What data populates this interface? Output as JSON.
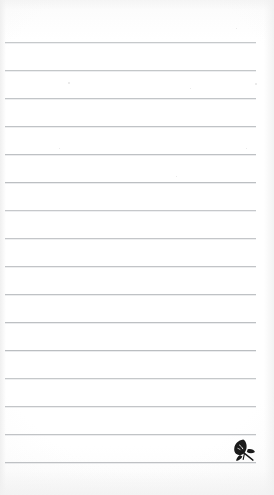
{
  "page": {
    "kind": "lined-notepad-scan",
    "width": 274,
    "height": 495,
    "paper_color": "#fdfdfd",
    "background_color": "#ffffff",
    "written_text": ""
  },
  "ruling": {
    "line_color": "#b9bcbf",
    "line_count": 16,
    "line_thickness_px": 1,
    "spacing_px": 28,
    "left_margin_px": 5,
    "right_margin_px": 18,
    "first_line_y": 42,
    "lines_y": [
      42,
      70,
      98,
      126,
      154,
      182,
      210,
      238,
      266,
      294,
      322,
      350,
      378,
      406,
      434,
      462
    ],
    "content": [
      "",
      "",
      "",
      "",
      "",
      "",
      "",
      "",
      "",
      "",
      "",
      "",
      "",
      "",
      "",
      ""
    ]
  },
  "brand": {
    "mark_name": "leaf-logo",
    "mark_color": "#1a1a1a",
    "x": 231,
    "y": 437,
    "size": 26,
    "label": ""
  },
  "artifacts": {
    "specks": [
      {
        "x": 68,
        "y": 82,
        "size": 2
      },
      {
        "x": 255,
        "y": 83,
        "size": 2
      },
      {
        "x": 59,
        "y": 148,
        "size": 1
      },
      {
        "x": 246,
        "y": 148,
        "size": 1
      },
      {
        "x": 176,
        "y": 176,
        "size": 1
      },
      {
        "x": 190,
        "y": 88,
        "size": 1
      },
      {
        "x": 236,
        "y": 28,
        "size": 1
      }
    ]
  }
}
